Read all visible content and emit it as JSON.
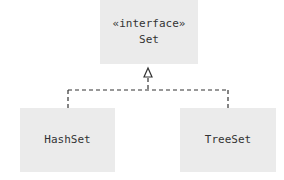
{
  "diagram": {
    "type": "uml-class-diagram",
    "interface": {
      "stereotype": "«interface»",
      "name": "Set"
    },
    "implementations": [
      {
        "name": "HashSet"
      },
      {
        "name": "TreeSet"
      }
    ],
    "relationship": "realization (dashed line with hollow triangle arrow)",
    "colors": {
      "box_fill": "#ebebeb",
      "line": "#333333",
      "text": "#333333"
    }
  }
}
